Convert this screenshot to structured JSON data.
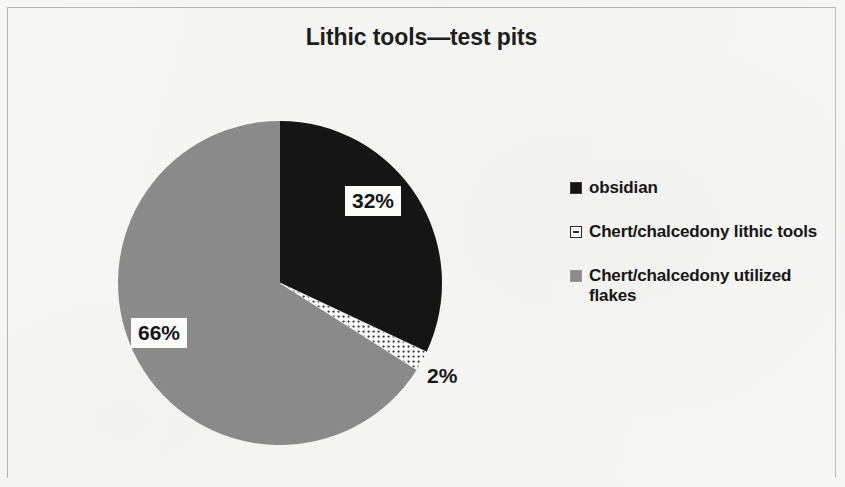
{
  "figure": {
    "title": "Lithic tools—test pits",
    "background_color": "#f6f6f4",
    "border_color": "#b4b4b2"
  },
  "chart_data": {
    "type": "pie",
    "title": "Lithic tools—test pits",
    "xlabel": "",
    "ylabel": "",
    "categories": [
      "obsidian",
      "Chert/chalcedony lithic tools",
      "Chert/chalcedony utilized flakes"
    ],
    "values": [
      32,
      2,
      66
    ],
    "value_labels": [
      "32%",
      "2%",
      "66%"
    ],
    "units": "percent",
    "colors": [
      "#151515",
      "#fafafa",
      "#8a8a8a"
    ],
    "slice_patterns": [
      "solid",
      "dotted",
      "solid"
    ],
    "start_angle_deg": 0,
    "direction": "clockwise",
    "legend_position": "right",
    "grid": false,
    "labels_inside": [
      true,
      false,
      true
    ]
  },
  "pie": {
    "center_x": 163,
    "center_y": 163,
    "radius": 162,
    "slices": [
      {
        "name": "obsidian",
        "percent": 32,
        "label": "32%",
        "color": "#151515",
        "label_boxed": true
      },
      {
        "name": "Chert/chalcedony lithic tools",
        "percent": 2,
        "label": "2%",
        "color": "#fafafa",
        "label_boxed": false
      },
      {
        "name": "Chert/chalcedony utilized flakes",
        "percent": 66,
        "label": "66%",
        "color": "#8a8a8a",
        "label_boxed": true
      }
    ]
  },
  "legend": {
    "items": [
      {
        "label": "obsidian",
        "swatch": "black-square-icon"
      },
      {
        "label": "Chert/chalcedony lithic tools",
        "swatch": "dotted-square-icon"
      },
      {
        "label": "Chert/chalcedony utilized flakes",
        "swatch": "gray-square-icon"
      }
    ]
  }
}
